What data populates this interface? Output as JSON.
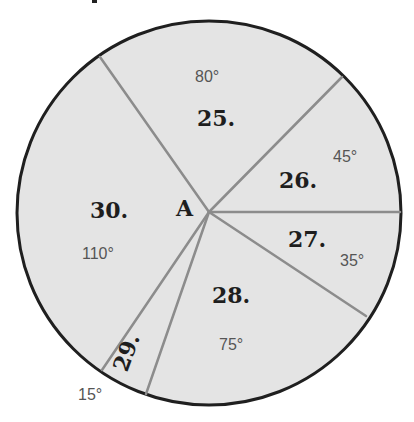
{
  "diagram": {
    "center_label": "A",
    "colors": {
      "fill": "#e4e4e4",
      "outline": "#1f1f1f",
      "divider": "#8c8c8c",
      "number_text": "#1e1e1e",
      "angle_text": "#555555"
    },
    "sectors": [
      {
        "number": "25.",
        "angle": "80°"
      },
      {
        "number": "26.",
        "angle": "45°"
      },
      {
        "number": "27.",
        "angle": "35°"
      },
      {
        "number": "28.",
        "angle": "75°"
      },
      {
        "number": "29.",
        "angle": "15°"
      },
      {
        "number": "30.",
        "angle": "110°"
      }
    ]
  }
}
